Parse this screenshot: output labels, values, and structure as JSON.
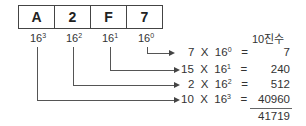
{
  "digits": [
    {
      "char": "A",
      "power": "16",
      "exp": "3"
    },
    {
      "char": "2",
      "power": "16",
      "exp": "2"
    },
    {
      "char": "F",
      "power": "16",
      "exp": "1"
    },
    {
      "char": "7",
      "power": "16",
      "exp": "0"
    }
  ],
  "header": "10진수",
  "rows": [
    {
      "coef": "7",
      "x": "X",
      "base": "16",
      "exp": "0",
      "eq": "=",
      "value": "7"
    },
    {
      "coef": "15",
      "x": "X",
      "base": "16",
      "exp": "1",
      "eq": "=",
      "value": "240"
    },
    {
      "coef": "2",
      "x": "X",
      "base": "16",
      "exp": "2",
      "eq": "=",
      "value": "512"
    },
    {
      "coef": "10",
      "x": "X",
      "base": "16",
      "exp": "3",
      "eq": "=",
      "value": "40960"
    }
  ],
  "total": "41719"
}
